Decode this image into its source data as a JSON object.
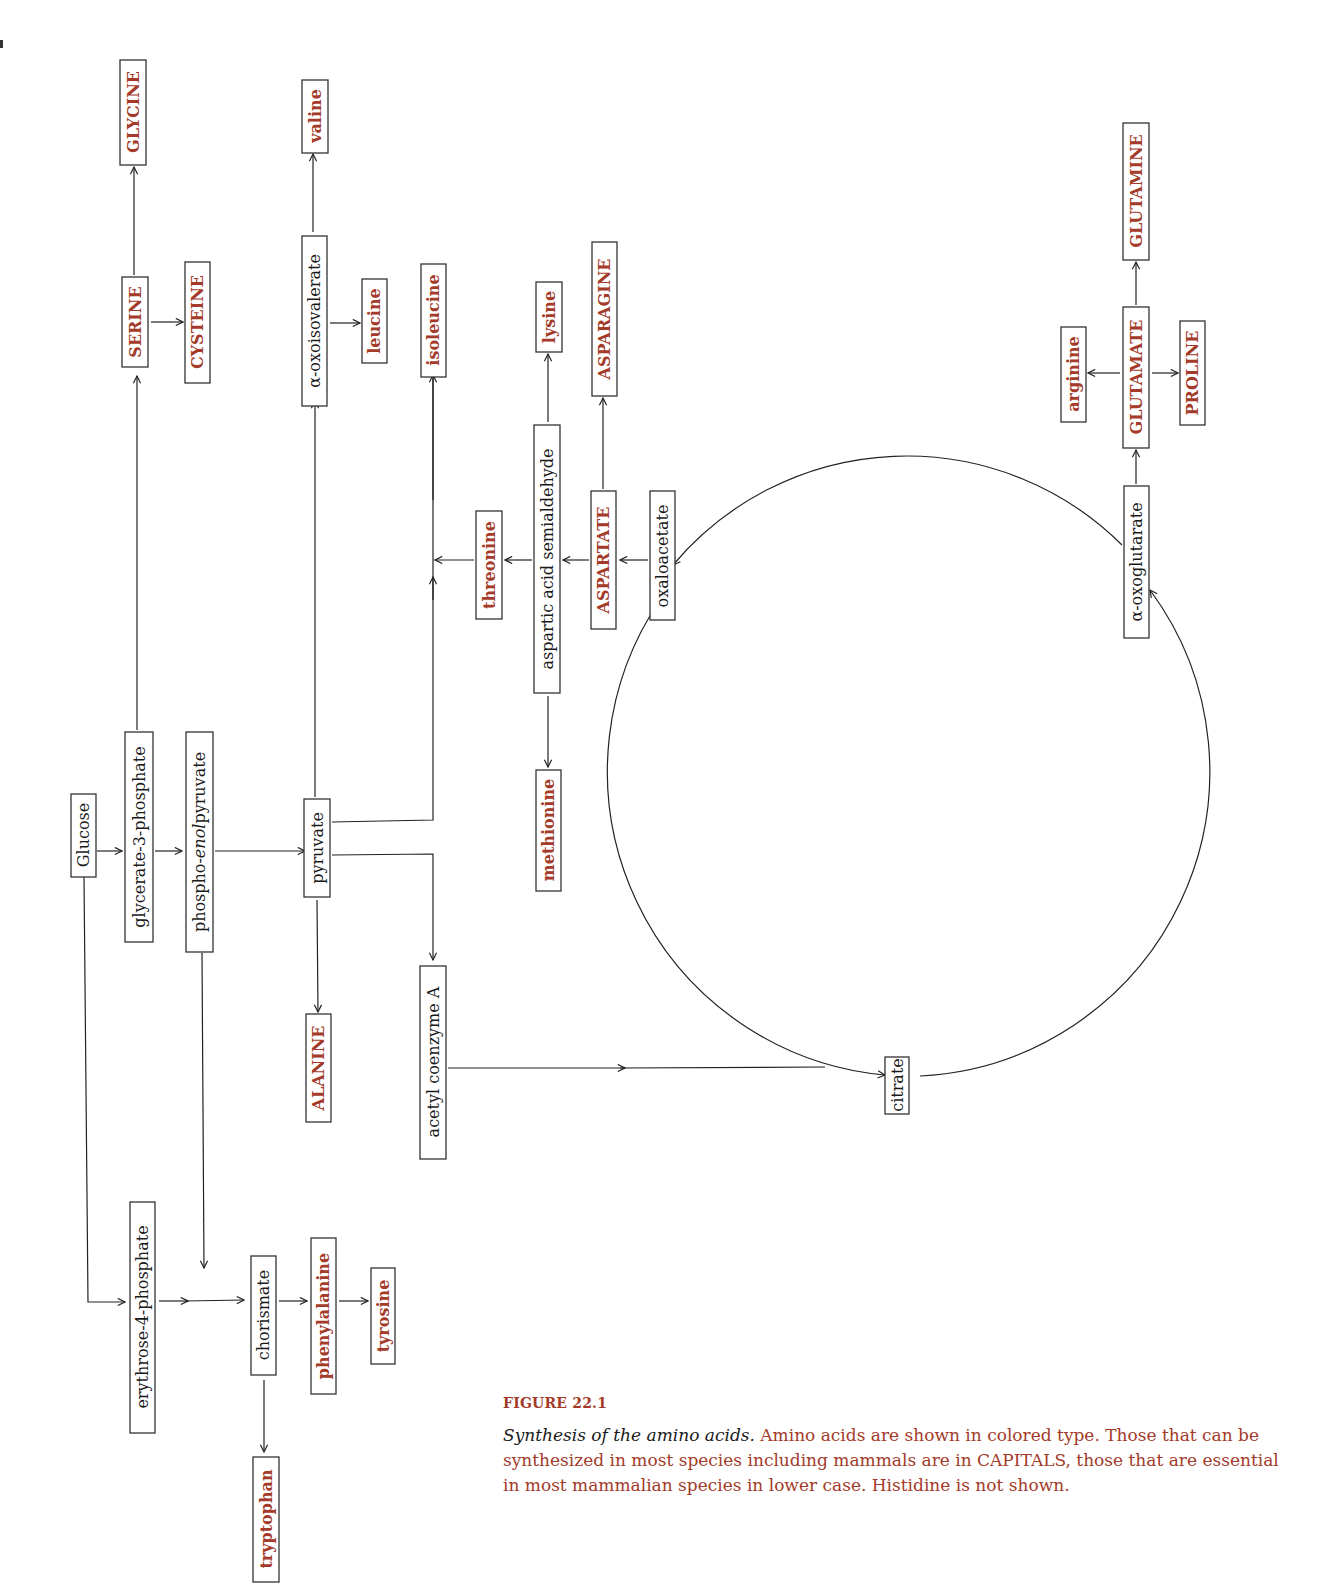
{
  "figure": {
    "label": "FIGURE 22.1",
    "title": "Synthesis of the amino acids.",
    "caption": " Amino acids are shown in colored type. Those that can be synthesized in most species including mammals are in CAPITALS, those that are essential in most mammalian species in lower case. Histidine is not shown."
  },
  "colors": {
    "amino_acid": "#a33a2a",
    "intermediate": "#1a1a1a",
    "line": "#222222"
  },
  "nodes": {
    "glucose": "Glucose",
    "glycerate3p": "glycerate-3-phosphate",
    "pep_a": "phospho-",
    "pep_b": "enol",
    "pep_c": "pyruvate",
    "pyruvate": "pyruvate",
    "serine": "SERINE",
    "glycine": "GLYCINE",
    "cysteine": "CYSTEINE",
    "oxoisovalerate": "α-oxoisovalerate",
    "valine": "valine",
    "leucine": "leucine",
    "isoleucine": "isoleucine",
    "alanine": "ALANINE",
    "acetylcoa": "acetyl coenzyme A",
    "threonine": "threonine",
    "aspartic_semialdehyde": "aspartic acid semialdehyde",
    "lysine": "lysine",
    "methionine": "methionine",
    "aspartate": "ASPARTATE",
    "asparagine": "ASPARAGINE",
    "oxaloacetate": "oxaloacetate",
    "citrate": "citrate",
    "oxoglutarate": "α-oxoglutarate",
    "glutamate": "GLUTAMATE",
    "glutamine": "GLUTAMINE",
    "arginine": "arginine",
    "proline": "PROLINE",
    "erythrose4p": "erythrose-4-phosphate",
    "chorismate": "chorismate",
    "phenylalanine": "phenylalanine",
    "tyrosine": "tyrosine",
    "tryptophan": "tryptophan"
  }
}
